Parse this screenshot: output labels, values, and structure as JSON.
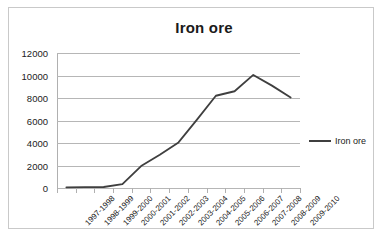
{
  "chart_data": {
    "type": "line",
    "title": "Iron ore",
    "xlabel": "",
    "ylabel": "",
    "ylim": [
      0,
      12000
    ],
    "yticks": [
      0,
      2000,
      4000,
      6000,
      8000,
      10000,
      12000
    ],
    "ytick_labels": [
      "0",
      "2000",
      "4000",
      "6000",
      "8000",
      "10000",
      "12000"
    ],
    "grid": true,
    "legend_position": "right",
    "categories": [
      "1997-1998",
      "1998-1999",
      "1999-2000",
      "2000-2001",
      "2001-2002",
      "2002-2003",
      "2003-2004",
      "2004-2005",
      "2005-2006",
      "2006-2007",
      "2007-2008",
      "2008-2009",
      "2009-2010"
    ],
    "series": [
      {
        "name": "Iron ore",
        "color": "#3f3f3f",
        "values": [
          60,
          70,
          90,
          350,
          1950,
          2950,
          4050,
          6100,
          8200,
          8600,
          10050,
          9100,
          8050
        ]
      }
    ]
  },
  "legend": {
    "entries": [
      {
        "label": "Iron ore",
        "swatch": "line-swatch"
      }
    ]
  }
}
